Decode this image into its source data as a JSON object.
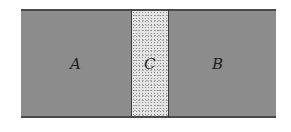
{
  "diagram": {
    "type": "layered-slab",
    "regions": [
      {
        "id": "A",
        "label": "A",
        "fill": "#8c8c8c",
        "pattern": "solid-gray"
      },
      {
        "id": "C",
        "label": "C",
        "fill": "#e4e4e4",
        "pattern": "stippled"
      },
      {
        "id": "B",
        "label": "B",
        "fill": "#8c8c8c",
        "pattern": "solid-gray"
      }
    ],
    "colors": {
      "boundary": "#4a4a4a",
      "divider": "#3a3a3a",
      "label": "#1e1e1e"
    }
  }
}
